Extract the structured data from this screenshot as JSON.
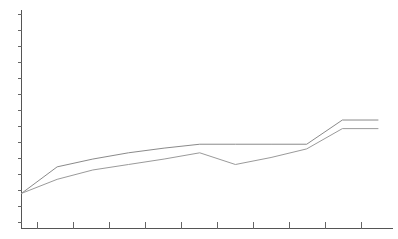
{
  "chart_data": {
    "type": "line",
    "title": "",
    "subtitle": "",
    "xlabel": "",
    "ylabel": "",
    "grid": false,
    "legend_position": "none",
    "background_color": "#ffffff",
    "axis_color": "#555555",
    "tick_color": "#666666",
    "xlim": [
      0,
      10
    ],
    "ylim": [
      0,
      14
    ],
    "x_tick_values": [
      1,
      2,
      3,
      4,
      5,
      6,
      7,
      8,
      9,
      10
    ],
    "x_tick_labels": [
      "",
      "",
      "",
      "",
      "",
      "",
      "",
      "",
      "",
      ""
    ],
    "y_tick_values": [
      1,
      2,
      3,
      4,
      5,
      6,
      7,
      8,
      9,
      10,
      11,
      12,
      13,
      14
    ],
    "y_tick_labels": [
      "",
      "",
      "",
      "",
      "",
      "",
      "",
      "",
      "",
      "",
      "",
      "",
      "",
      ""
    ],
    "x": [
      0.0,
      1.0,
      2.0,
      3.0,
      4.0,
      5.0,
      6.0,
      7.0,
      8.0,
      9.0,
      10.0
    ],
    "series": [
      {
        "name": "series-1",
        "color": "#8a8a8a",
        "values": [
          2.25,
          3.95,
          4.45,
          4.85,
          5.15,
          5.4,
          5.4,
          5.4,
          5.4,
          6.95,
          6.95
        ]
      },
      {
        "name": "series-2",
        "color": "#9a9a9a",
        "values": [
          2.25,
          3.15,
          3.75,
          4.1,
          4.45,
          4.85,
          4.1,
          4.55,
          5.1,
          6.4,
          6.4
        ]
      }
    ],
    "annotations": []
  },
  "figure": {
    "alt_description": "Unlabeled two-series line chart on white background",
    "series_1_label": "",
    "series_2_label": ""
  }
}
